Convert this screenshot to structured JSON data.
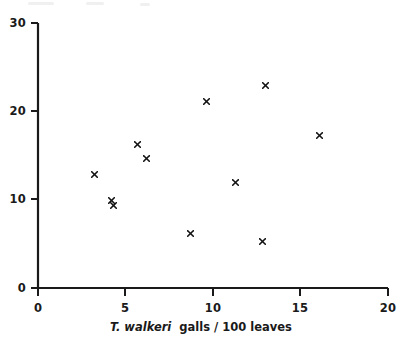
{
  "chart_data": {
    "type": "scatter",
    "title": "",
    "xlabel_italic": "T. walkeri",
    "xlabel_rest": "galls / 100 leaves",
    "xlabel": "T. walkeri galls / 100 leaves",
    "ylabel": "",
    "xlim": [
      0,
      20
    ],
    "ylim": [
      0,
      30
    ],
    "xticks": [
      0,
      5,
      10,
      15,
      20
    ],
    "yticks": [
      0,
      10,
      20,
      30
    ],
    "xtick_labels": [
      "0",
      "5",
      "10",
      "15",
      "20"
    ],
    "ytick_labels": [
      "0",
      "10",
      "20",
      "30"
    ],
    "grid": false,
    "legend": false,
    "marker": "x",
    "marker_color": "#121212",
    "axis_color": "#1a1a1a",
    "background": "#ffffff",
    "points": [
      {
        "x": 3.2,
        "y": 12.8
      },
      {
        "x": 4.2,
        "y": 9.9
      },
      {
        "x": 4.3,
        "y": 9.3
      },
      {
        "x": 5.7,
        "y": 16.2
      },
      {
        "x": 6.2,
        "y": 14.7
      },
      {
        "x": 8.7,
        "y": 6.2
      },
      {
        "x": 9.6,
        "y": 21.1
      },
      {
        "x": 11.3,
        "y": 12.0
      },
      {
        "x": 12.8,
        "y": 5.3
      },
      {
        "x": 13.0,
        "y": 22.9
      },
      {
        "x": 16.1,
        "y": 17.3
      }
    ],
    "n_points": 11
  }
}
